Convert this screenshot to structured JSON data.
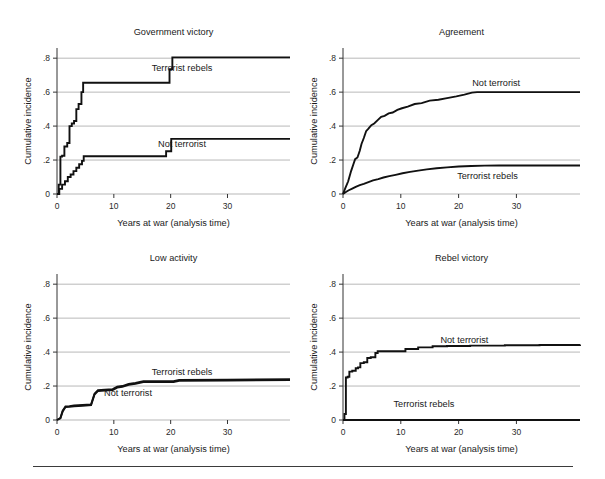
{
  "figure": {
    "background": "#ffffff",
    "line_color": "#111111",
    "grid_color": "#9a9a9a",
    "axis_color": "#333333",
    "shared_xlabel": "Years at war (analysis time)",
    "shared_ylabel": "Cumulative incidence",
    "xticks": [
      "0",
      "10",
      "20",
      "30"
    ],
    "xtick_values": [
      0,
      10,
      20,
      30
    ],
    "yticks": [
      "0",
      ".2",
      ".4",
      ".6",
      ".8"
    ],
    "ytick_values": [
      0,
      0.2,
      0.4,
      0.6,
      0.8
    ],
    "xlim": [
      -1.5,
      41
    ],
    "ylim": [
      0,
      0.86
    ],
    "has_footer_rule": true
  },
  "chart_data": [
    {
      "type": "line",
      "panel": "top-left",
      "title": "Government victory",
      "xlabel": "Years at war (analysis time)",
      "ylabel": "Cumulative incidence",
      "xlim": [
        -1.5,
        41
      ],
      "ylim": [
        0,
        0.86
      ],
      "xticks": [
        0,
        10,
        20,
        30
      ],
      "yticks": [
        0,
        0.2,
        0.4,
        0.6,
        0.8
      ],
      "grid": true,
      "legend": "inline-annotation",
      "series": [
        {
          "name": "Terrorist rebels",
          "label_x": 22.0,
          "label_y": 0.745,
          "x": [
            0,
            0.3,
            0.6,
            0.9,
            1.3,
            1.8,
            2.2,
            2.6,
            3.0,
            3.4,
            3.8,
            4.3,
            4.6,
            19.0,
            19.8,
            20.3,
            41
          ],
          "y": [
            0.0,
            0.055,
            0.22,
            0.225,
            0.28,
            0.3,
            0.4,
            0.415,
            0.43,
            0.5,
            0.53,
            0.6,
            0.655,
            0.655,
            0.735,
            0.805,
            0.805
          ]
        },
        {
          "name": "Not terrorist",
          "label_x": 22.0,
          "label_y": 0.295,
          "x": [
            0,
            0.4,
            0.9,
            1.4,
            1.9,
            2.4,
            2.9,
            3.4,
            3.9,
            4.4,
            4.7,
            18.4,
            19.2,
            20.1,
            41
          ],
          "y": [
            0.0,
            0.03,
            0.055,
            0.075,
            0.1,
            0.115,
            0.135,
            0.155,
            0.175,
            0.195,
            0.222,
            0.222,
            0.252,
            0.325,
            0.325
          ]
        }
      ]
    },
    {
      "type": "line",
      "panel": "top-right",
      "title": "Agreement",
      "xlabel": "Years at war (analysis time)",
      "ylabel": "Cumulative incidence",
      "xlim": [
        -1.5,
        41
      ],
      "ylim": [
        0,
        0.86
      ],
      "xticks": [
        0,
        10,
        20,
        30
      ],
      "yticks": [
        0,
        0.2,
        0.4,
        0.6,
        0.8
      ],
      "grid": true,
      "legend": "inline-annotation",
      "series": [
        {
          "name": "Not terrorist",
          "label_x": 26.5,
          "label_y": 0.655,
          "x": [
            0,
            0.4,
            0.9,
            1.4,
            1.8,
            2.1,
            2.5,
            2.9,
            3.2,
            3.6,
            4.0,
            4.4,
            4.9,
            5.4,
            6.0,
            6.6,
            7.2,
            7.9,
            8.6,
            9.4,
            10.2,
            11.2,
            12.4,
            13.6,
            15.0,
            16.5,
            18.0,
            19.6,
            21.0,
            22.3,
            23.2,
            41
          ],
          "y": [
            0.0,
            0.035,
            0.075,
            0.135,
            0.175,
            0.205,
            0.215,
            0.255,
            0.295,
            0.33,
            0.37,
            0.385,
            0.405,
            0.415,
            0.435,
            0.455,
            0.46,
            0.475,
            0.48,
            0.495,
            0.505,
            0.515,
            0.53,
            0.535,
            0.55,
            0.555,
            0.565,
            0.575,
            0.585,
            0.597,
            0.6,
            0.6
          ]
        },
        {
          "name": "Terrorist rebels",
          "label_x": 25.0,
          "label_y": 0.105,
          "x": [
            0,
            0.5,
            1.0,
            1.6,
            2.2,
            2.9,
            3.6,
            4.4,
            5.2,
            6.1,
            7.0,
            8.0,
            9.1,
            10.3,
            11.6,
            13.0,
            14.5,
            16.2,
            18.0,
            20.0,
            22.2,
            24.5,
            27.0,
            41
          ],
          "y": [
            0.0,
            0.012,
            0.022,
            0.032,
            0.042,
            0.052,
            0.06,
            0.07,
            0.08,
            0.088,
            0.097,
            0.105,
            0.113,
            0.122,
            0.13,
            0.138,
            0.145,
            0.152,
            0.157,
            0.162,
            0.165,
            0.167,
            0.168,
            0.168
          ]
        }
      ]
    },
    {
      "type": "line",
      "panel": "bottom-left",
      "title": "Low activity",
      "xlabel": "Years at war (analysis time)",
      "ylabel": "Cumulative incidence",
      "xlim": [
        -1.5,
        41
      ],
      "ylim": [
        0,
        0.86
      ],
      "xticks": [
        0,
        10,
        20,
        30
      ],
      "yticks": [
        0,
        0.2,
        0.4,
        0.6,
        0.8
      ],
      "grid": true,
      "legend": "inline-annotation",
      "series": [
        {
          "name": "Terrorist rebels",
          "label_x": 22.0,
          "label_y": 0.285,
          "x": [
            0,
            0.6,
            1.0,
            1.5,
            2.2,
            3.0,
            4.5,
            6.0,
            6.6,
            7.2,
            8.4,
            9.8,
            10.6,
            11.5,
            12.6,
            13.8,
            15.2,
            16.0,
            18.0,
            20.5,
            21.5,
            30.0,
            41
          ],
          "y": [
            0.0,
            0.012,
            0.055,
            0.08,
            0.082,
            0.085,
            0.088,
            0.092,
            0.155,
            0.175,
            0.178,
            0.182,
            0.196,
            0.2,
            0.212,
            0.218,
            0.228,
            0.228,
            0.228,
            0.228,
            0.236,
            0.238,
            0.24
          ]
        },
        {
          "name": "Not terrorist",
          "label_x": 12.5,
          "label_y": 0.158,
          "x": [
            0,
            0.6,
            1.0,
            1.5,
            2.2,
            3.0,
            4.5,
            6.0,
            6.6,
            7.2,
            8.4,
            9.8,
            10.6,
            11.5,
            12.6,
            13.8,
            15.2,
            16.0,
            18.0,
            20.5,
            21.5,
            30.0,
            41
          ],
          "y": [
            0.0,
            0.01,
            0.05,
            0.076,
            0.078,
            0.081,
            0.084,
            0.088,
            0.15,
            0.17,
            0.173,
            0.177,
            0.191,
            0.195,
            0.207,
            0.213,
            0.223,
            0.223,
            0.223,
            0.223,
            0.231,
            0.233,
            0.235
          ]
        }
      ]
    },
    {
      "type": "line",
      "panel": "bottom-right",
      "title": "Rebel victory",
      "xlabel": "Years at war (analysis time)",
      "ylabel": "Cumulative incidence",
      "xlim": [
        -1.5,
        41
      ],
      "ylim": [
        0,
        0.86
      ],
      "xticks": [
        0,
        10,
        20,
        30
      ],
      "yticks": [
        0,
        0.2,
        0.4,
        0.6,
        0.8
      ],
      "grid": true,
      "legend": "inline-annotation",
      "series": [
        {
          "name": "Not terrorist",
          "label_x": 21.0,
          "label_y": 0.475,
          "x": [
            0,
            0.25,
            0.5,
            0.8,
            1.1,
            1.6,
            2.2,
            2.6,
            3.0,
            3.6,
            4.2,
            4.8,
            5.6,
            6.0,
            10.8,
            13.0,
            15.5,
            18.0,
            22.0,
            28.0,
            34.0,
            41
          ],
          "y": [
            0.0,
            0.035,
            0.25,
            0.255,
            0.285,
            0.29,
            0.305,
            0.31,
            0.335,
            0.34,
            0.365,
            0.37,
            0.395,
            0.405,
            0.418,
            0.428,
            0.434,
            0.436,
            0.438,
            0.44,
            0.442,
            0.444
          ]
        },
        {
          "name": "Terrorist rebels",
          "label_x": 14.0,
          "label_y": 0.095,
          "x": [
            0,
            41
          ],
          "y": [
            0.0,
            0.0
          ]
        }
      ]
    }
  ]
}
